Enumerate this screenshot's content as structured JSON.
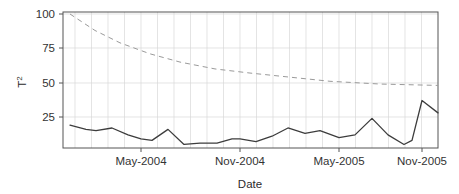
{
  "chart_data": {
    "type": "line",
    "title": "",
    "xlabel": "Date",
    "ylabel": "T2",
    "ylabel_display": "T",
    "ylabel_superscript": "2",
    "ylim": [
      0,
      105
    ],
    "xlim_labels": [
      "May-2004",
      "Nov-2004",
      "May-2005",
      "Nov-2005"
    ],
    "ytick_values": [
      25,
      50,
      75,
      100
    ],
    "ytick_labels": [
      "25",
      "50",
      "75",
      "100"
    ],
    "xtick_labels": [
      "May-2004",
      "Nov-2004",
      "May-2005",
      "Nov-2005"
    ],
    "grid": true,
    "grid_minor_vertical": "monthly",
    "legend": "none",
    "colors": {
      "observed_line": "#3d3d3d",
      "control_limit_line": "#9a9a9a",
      "grid": "#d9d9d9",
      "axis": "#555555",
      "background": "#ffffff"
    },
    "series": [
      {
        "name": "T2 statistic",
        "style": "solid",
        "x": [
          "2004-02",
          "2004-03",
          "2004-04",
          "2004-05",
          "2004-06",
          "2004-07",
          "2004-08",
          "2004-09",
          "2004-10",
          "2004-11",
          "2004-12",
          "2005-01",
          "2005-02",
          "2005-03",
          "2005-04",
          "2005-05",
          "2005-06",
          "2005-07",
          "2005-08",
          "2005-09",
          "2005-10",
          "2005-11",
          "2005-12"
        ],
        "values": [
          19,
          16,
          15,
          17,
          12,
          9,
          8,
          16,
          5,
          6,
          6,
          9,
          9,
          7,
          11,
          17,
          13,
          15,
          10,
          12,
          24,
          12,
          5
        ]
      },
      {
        "name": "T2 statistic (continued)",
        "style": "solid",
        "x": [
          "2005-12",
          "2006-01",
          "2006-02"
        ],
        "values": [
          5,
          8,
          37
        ]
      },
      {
        "name": "Control limit",
        "style": "dashed",
        "x": [
          "2004-02",
          "2004-05",
          "2004-08",
          "2004-11",
          "2005-02",
          "2005-05",
          "2005-08",
          "2005-11",
          "2006-02"
        ],
        "values": [
          100,
          86,
          75,
          67,
          61,
          56,
          53,
          50,
          48
        ]
      }
    ],
    "observed_points": [
      {
        "x": 70,
        "y": 19
      },
      {
        "x": 86,
        "y": 16
      },
      {
        "x": 96,
        "y": 15
      },
      {
        "x": 112,
        "y": 17
      },
      {
        "x": 128,
        "y": 12
      },
      {
        "x": 141,
        "y": 9
      },
      {
        "x": 152,
        "y": 8
      },
      {
        "x": 168,
        "y": 16
      },
      {
        "x": 184,
        "y": 5
      },
      {
        "x": 200,
        "y": 6
      },
      {
        "x": 217,
        "y": 6
      },
      {
        "x": 232,
        "y": 9
      },
      {
        "x": 240,
        "y": 9
      },
      {
        "x": 256,
        "y": 7
      },
      {
        "x": 272,
        "y": 11
      },
      {
        "x": 288,
        "y": 17
      },
      {
        "x": 305,
        "y": 13
      },
      {
        "x": 320,
        "y": 15
      },
      {
        "x": 339,
        "y": 10
      },
      {
        "x": 355,
        "y": 12
      },
      {
        "x": 372,
        "y": 24
      },
      {
        "x": 388,
        "y": 12
      },
      {
        "x": 404,
        "y": 5
      },
      {
        "x": 412,
        "y": 8
      },
      {
        "x": 422,
        "y": 37
      },
      {
        "x": 438,
        "y": 28
      }
    ],
    "limit_points": [
      {
        "x": 70,
        "y": 100
      },
      {
        "x": 95,
        "y": 88
      },
      {
        "x": 120,
        "y": 79
      },
      {
        "x": 150,
        "y": 71
      },
      {
        "x": 180,
        "y": 65
      },
      {
        "x": 215,
        "y": 60
      },
      {
        "x": 250,
        "y": 57
      },
      {
        "x": 290,
        "y": 54
      },
      {
        "x": 330,
        "y": 51
      },
      {
        "x": 380,
        "y": 49
      },
      {
        "x": 438,
        "y": 48
      }
    ]
  },
  "axes": {
    "plot_left": 63,
    "plot_right": 438,
    "plot_top": 12,
    "plot_bottom": 148,
    "y_pixel_at_25": 117,
    "y_pixel_at_100": 14,
    "xtick_pixels": [
      141,
      240,
      339,
      422
    ],
    "ytick_pixels": [
      117,
      83,
      48,
      14
    ]
  }
}
